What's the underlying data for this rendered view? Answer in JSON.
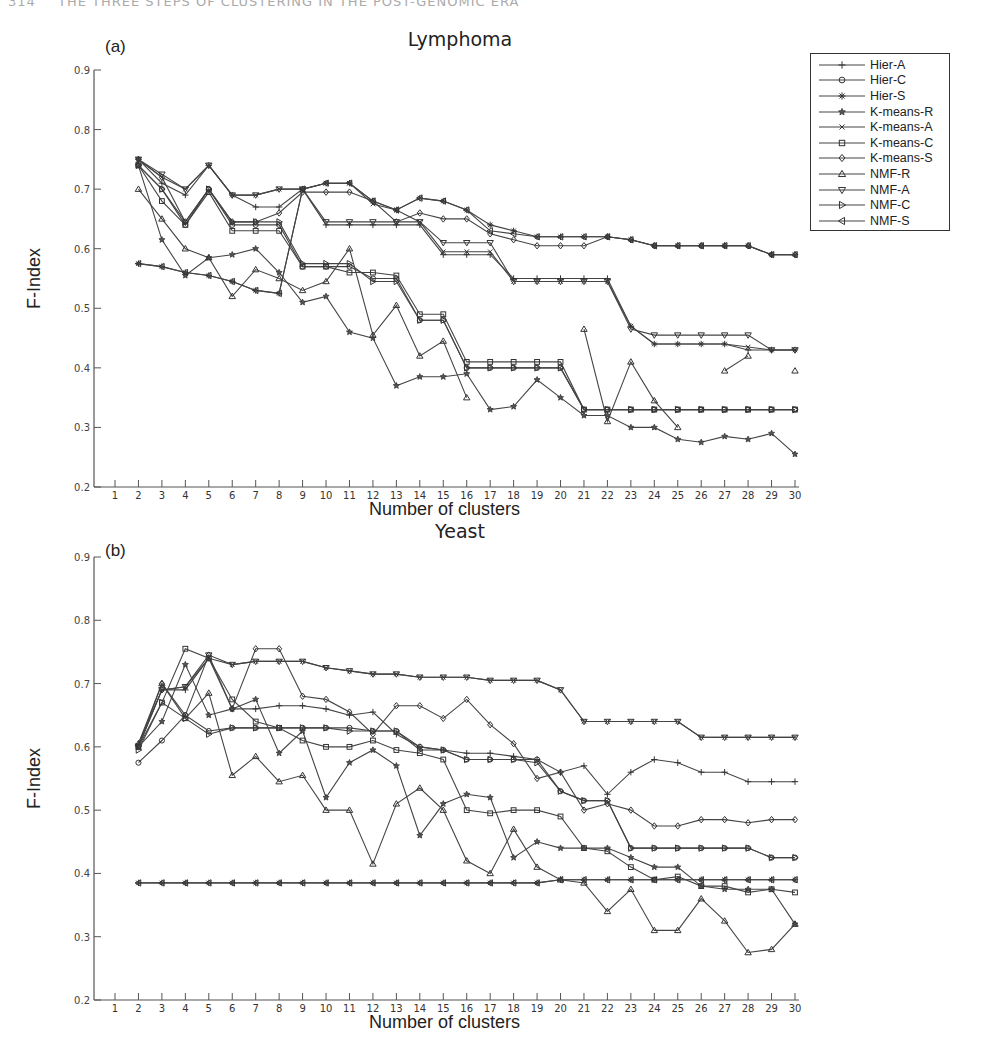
{
  "page_header": {
    "page_number": "314",
    "running_title": "THE THREE STEPS OF CLUSTERING IN THE POST-GENOMIC ERA"
  },
  "legend": [
    {
      "name": "Hier-A",
      "marker": "plus"
    },
    {
      "name": "Hier-C",
      "marker": "circle"
    },
    {
      "name": "Hier-S",
      "marker": "asterisk"
    },
    {
      "name": "K-means-R",
      "marker": "star"
    },
    {
      "name": "K-means-A",
      "marker": "x"
    },
    {
      "name": "K-means-C",
      "marker": "square"
    },
    {
      "name": "K-means-S",
      "marker": "diamond"
    },
    {
      "name": "NMF-R",
      "marker": "triangle-up"
    },
    {
      "name": "NMF-A",
      "marker": "triangle-down"
    },
    {
      "name": "NMF-C",
      "marker": "triangle-right"
    },
    {
      "name": "NMF-S",
      "marker": "triangle-left"
    }
  ],
  "chart_data": [
    {
      "type": "line",
      "panel": "(a)",
      "title": "Lymphoma",
      "xlabel": "Number of clusters",
      "ylabel": "F-Index",
      "ylim": [
        0.2,
        0.9
      ],
      "yticks": [
        "0.2",
        "0.3",
        "0.4",
        "0.5",
        "0.6",
        "0.7",
        "0.8",
        "0.9"
      ],
      "xticks": [
        "1",
        "2",
        "3",
        "4",
        "5",
        "6",
        "7",
        "8",
        "9",
        "10",
        "11",
        "12",
        "13",
        "14",
        "15",
        "16",
        "17",
        "18",
        "19",
        "20",
        "21",
        "22",
        "23",
        "24",
        "25",
        "26",
        "27",
        "28",
        "29",
        "30"
      ],
      "grid": false,
      "legend_position": "upper right, outside",
      "x": [
        2,
        3,
        4,
        5,
        6,
        7,
        8,
        9,
        10,
        11,
        12,
        13,
        14,
        15,
        16,
        17,
        18,
        19,
        20,
        21,
        22,
        23,
        24,
        25,
        26,
        27,
        28,
        29,
        30
      ],
      "series": [
        {
          "name": "Hier-A",
          "values": [
            0.75,
            0.71,
            0.69,
            0.74,
            0.69,
            0.67,
            0.67,
            0.7,
            0.64,
            0.64,
            0.64,
            0.64,
            0.64,
            0.59,
            0.59,
            0.59,
            0.55,
            0.55,
            0.55,
            0.55,
            0.55,
            0.47,
            0.44,
            0.44,
            0.44,
            0.44,
            0.43,
            0.43,
            0.43
          ]
        },
        {
          "name": "Hier-C",
          "values": [
            0.74,
            0.7,
            0.64,
            0.7,
            0.64,
            0.64,
            0.64,
            0.57,
            0.57,
            0.57,
            0.55,
            0.55,
            0.48,
            0.48,
            0.4,
            0.4,
            0.4,
            0.4,
            0.4,
            0.33,
            0.33,
            0.33,
            0.33,
            0.33,
            0.33,
            0.33,
            0.33,
            0.33,
            0.33
          ]
        },
        {
          "name": "Hier-S",
          "values": [
            0.575,
            0.57,
            0.56,
            0.555,
            0.545,
            0.53,
            0.525,
            0.7,
            0.71,
            0.71,
            0.68,
            0.665,
            0.685,
            0.68,
            0.665,
            0.64,
            0.63,
            0.62,
            0.62,
            0.62,
            0.62,
            0.615,
            0.605,
            0.605,
            0.605,
            0.605,
            0.605,
            0.59,
            0.59
          ]
        },
        {
          "name": "K-means-R",
          "values": [
            0.74,
            0.615,
            0.555,
            0.585,
            0.59,
            0.6,
            0.56,
            0.51,
            0.52,
            0.46,
            0.45,
            0.37,
            0.385,
            0.385,
            0.39,
            0.33,
            0.335,
            0.38,
            0.35,
            0.32,
            0.32,
            0.3,
            0.3,
            0.28,
            0.275,
            0.285,
            0.28,
            0.29,
            0.255
          ]
        },
        {
          "name": "K-means-A",
          "values": [
            0.75,
            0.72,
            0.7,
            0.74,
            0.69,
            0.69,
            0.7,
            0.7,
            0.71,
            0.71,
            0.675,
            0.665,
            0.645,
            0.595,
            0.595,
            0.595,
            0.545,
            0.545,
            0.545,
            0.545,
            0.545,
            0.47,
            0.44,
            0.44,
            0.44,
            0.44,
            0.435,
            0.43,
            0.43
          ]
        },
        {
          "name": "K-means-C",
          "values": [
            0.74,
            0.68,
            0.64,
            0.695,
            0.63,
            0.63,
            0.63,
            0.57,
            0.57,
            0.56,
            0.56,
            0.555,
            0.49,
            0.49,
            0.41,
            0.41,
            0.41,
            0.41,
            0.41,
            0.33,
            0.33,
            0.33,
            0.33,
            0.33,
            0.33,
            0.33,
            0.33,
            0.33,
            0.33
          ]
        },
        {
          "name": "K-means-S",
          "values": [
            0.75,
            0.72,
            0.645,
            0.7,
            0.645,
            0.645,
            0.66,
            0.695,
            0.695,
            0.695,
            0.68,
            0.645,
            0.66,
            0.65,
            0.65,
            0.625,
            0.615,
            0.605,
            0.605,
            0.605,
            0.62,
            0.615,
            0.605,
            0.605,
            0.605,
            0.605,
            0.605,
            0.59,
            0.59
          ]
        },
        {
          "name": "NMF-R",
          "values": [
            0.7,
            0.65,
            0.6,
            0.585,
            0.52,
            0.565,
            0.55,
            0.53,
            0.545,
            0.6,
            0.455,
            0.505,
            0.42,
            0.445,
            0.35,
            null,
            null,
            null,
            null,
            0.465,
            0.31,
            0.41,
            0.345,
            0.3,
            null,
            0.395,
            0.42,
            null,
            0.395
          ]
        },
        {
          "name": "NMF-A",
          "values": [
            0.75,
            0.725,
            0.7,
            0.74,
            0.69,
            0.69,
            0.7,
            0.7,
            0.645,
            0.645,
            0.645,
            0.645,
            0.645,
            0.61,
            0.61,
            0.61,
            0.545,
            0.545,
            0.545,
            0.545,
            0.545,
            0.465,
            0.455,
            0.455,
            0.455,
            0.455,
            0.455,
            0.43,
            0.43
          ]
        },
        {
          "name": "NMF-C",
          "values": [
            0.74,
            0.7,
            0.645,
            0.7,
            0.645,
            0.645,
            0.645,
            0.575,
            0.575,
            0.575,
            0.545,
            0.545,
            0.48,
            0.48,
            0.4,
            0.4,
            0.4,
            0.4,
            0.4,
            0.33,
            0.33,
            0.33,
            0.33,
            0.33,
            0.33,
            0.33,
            0.33,
            0.33,
            0.33
          ]
        },
        {
          "name": "NMF-S",
          "values": [
            0.575,
            0.57,
            0.56,
            0.555,
            0.545,
            0.53,
            0.525,
            0.7,
            0.71,
            0.71,
            0.68,
            0.665,
            0.685,
            0.68,
            0.665,
            0.63,
            0.625,
            0.62,
            0.62,
            0.62,
            0.62,
            0.615,
            0.605,
            0.605,
            0.605,
            0.605,
            0.605,
            0.59,
            0.59
          ]
        }
      ]
    },
    {
      "type": "line",
      "panel": "(b)",
      "title": "Yeast",
      "xlabel": "Number of clusters",
      "ylabel": "F-Index",
      "ylim": [
        0.2,
        0.9
      ],
      "yticks": [
        "0.2",
        "0.3",
        "0.4",
        "0.5",
        "0.6",
        "0.7",
        "0.8",
        "0.9"
      ],
      "xticks": [
        "1",
        "2",
        "3",
        "4",
        "5",
        "6",
        "7",
        "8",
        "9",
        "10",
        "11",
        "12",
        "13",
        "14",
        "15",
        "16",
        "17",
        "18",
        "19",
        "20",
        "21",
        "22",
        "23",
        "24",
        "25",
        "26",
        "27",
        "28",
        "29",
        "30"
      ],
      "grid": false,
      "x": [
        2,
        3,
        4,
        5,
        6,
        7,
        8,
        9,
        10,
        11,
        12,
        13,
        14,
        15,
        16,
        17,
        18,
        19,
        20,
        21,
        22,
        23,
        24,
        25,
        26,
        27,
        28,
        29,
        30
      ],
      "series": [
        {
          "name": "Hier-A",
          "values": [
            0.605,
            0.69,
            0.69,
            0.74,
            0.66,
            0.66,
            0.665,
            0.665,
            0.66,
            0.65,
            0.655,
            0.62,
            0.6,
            0.595,
            0.59,
            0.59,
            0.585,
            0.58,
            0.56,
            0.57,
            0.525,
            0.56,
            0.58,
            0.575,
            0.56,
            0.56,
            0.545,
            0.545,
            0.545
          ]
        },
        {
          "name": "Hier-C",
          "values": [
            0.575,
            0.61,
            0.65,
            0.625,
            0.63,
            0.63,
            0.63,
            0.63,
            0.63,
            0.63,
            0.625,
            0.625,
            0.6,
            0.595,
            0.58,
            0.58,
            0.58,
            0.58,
            0.53,
            0.515,
            0.515,
            0.44,
            0.44,
            0.44,
            0.44,
            0.44,
            0.44,
            0.425,
            0.425
          ]
        },
        {
          "name": "Hier-S",
          "values": [
            0.385,
            0.385,
            0.385,
            0.385,
            0.385,
            0.385,
            0.385,
            0.385,
            0.385,
            0.385,
            0.385,
            0.385,
            0.385,
            0.385,
            0.385,
            0.385,
            0.385,
            0.385,
            0.39,
            0.39,
            0.39,
            0.39,
            0.39,
            0.39,
            0.39,
            0.39,
            0.39,
            0.39,
            0.39
          ]
        },
        {
          "name": "K-means-R",
          "values": [
            0.6,
            0.64,
            0.73,
            0.65,
            0.66,
            0.675,
            0.59,
            0.625,
            0.52,
            0.575,
            0.595,
            0.57,
            0.46,
            0.51,
            0.525,
            0.52,
            0.425,
            0.45,
            0.44,
            0.44,
            0.44,
            0.425,
            0.41,
            0.41,
            0.38,
            0.375,
            0.375,
            0.375,
            0.32
          ]
        },
        {
          "name": "K-means-A",
          "values": [
            0.6,
            0.69,
            0.695,
            0.74,
            0.73,
            0.735,
            0.735,
            0.735,
            0.725,
            0.72,
            0.715,
            0.715,
            0.71,
            0.71,
            0.71,
            0.705,
            0.705,
            0.705,
            0.69,
            0.64,
            0.64,
            0.64,
            0.64,
            0.64,
            0.615,
            0.615,
            0.615,
            0.615,
            0.615
          ]
        },
        {
          "name": "K-means-C",
          "values": [
            0.6,
            0.67,
            0.755,
            0.74,
            0.675,
            0.64,
            0.63,
            0.61,
            0.6,
            0.6,
            0.61,
            0.595,
            0.59,
            0.58,
            0.5,
            0.495,
            0.5,
            0.5,
            0.49,
            0.44,
            0.435,
            0.41,
            0.39,
            0.395,
            0.38,
            0.38,
            0.37,
            0.375,
            0.37
          ]
        },
        {
          "name": "K-means-S",
          "values": [
            0.6,
            0.7,
            0.65,
            0.745,
            0.66,
            0.755,
            0.755,
            0.68,
            0.675,
            0.655,
            0.62,
            0.665,
            0.665,
            0.645,
            0.675,
            0.635,
            0.605,
            0.55,
            0.56,
            0.5,
            0.51,
            0.5,
            0.475,
            0.475,
            0.485,
            0.485,
            0.48,
            0.485,
            0.485
          ]
        },
        {
          "name": "NMF-R",
          "values": [
            0.605,
            0.7,
            0.645,
            0.685,
            0.555,
            0.585,
            0.545,
            0.555,
            0.5,
            0.5,
            0.415,
            0.51,
            0.535,
            0.5,
            0.42,
            0.4,
            0.47,
            0.41,
            0.39,
            0.385,
            0.34,
            0.375,
            0.31,
            0.31,
            0.36,
            0.325,
            0.275,
            0.28,
            0.32
          ]
        },
        {
          "name": "NMF-A",
          "values": [
            0.6,
            0.69,
            0.695,
            0.745,
            0.73,
            0.735,
            0.735,
            0.735,
            0.725,
            0.72,
            0.715,
            0.715,
            0.71,
            0.71,
            0.71,
            0.705,
            0.705,
            0.705,
            0.69,
            0.64,
            0.64,
            0.64,
            0.64,
            0.64,
            0.615,
            0.615,
            0.615,
            0.615,
            0.615
          ]
        },
        {
          "name": "NMF-C",
          "values": [
            0.595,
            0.67,
            0.645,
            0.62,
            0.63,
            0.63,
            0.63,
            0.63,
            0.63,
            0.625,
            0.625,
            0.625,
            0.595,
            0.595,
            0.58,
            0.58,
            0.58,
            0.575,
            0.53,
            0.515,
            0.515,
            0.44,
            0.44,
            0.44,
            0.44,
            0.44,
            0.44,
            0.425,
            0.425
          ]
        },
        {
          "name": "NMF-S",
          "values": [
            0.385,
            0.385,
            0.385,
            0.385,
            0.385,
            0.385,
            0.385,
            0.385,
            0.385,
            0.385,
            0.385,
            0.385,
            0.385,
            0.385,
            0.385,
            0.385,
            0.385,
            0.385,
            0.39,
            0.39,
            0.39,
            0.39,
            0.39,
            0.39,
            0.39,
            0.39,
            0.39,
            0.39,
            0.39
          ]
        }
      ]
    }
  ]
}
